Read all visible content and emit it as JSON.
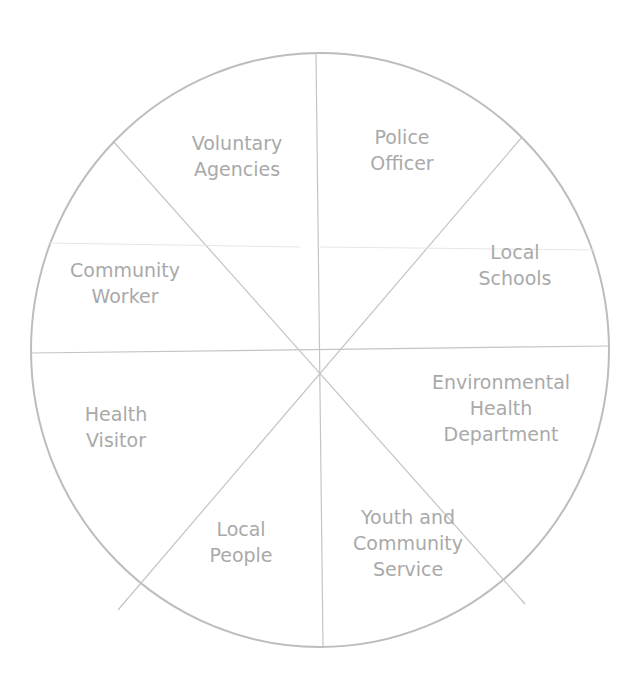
{
  "diagram": {
    "type": "segmented-circle",
    "line_color": "#bdbdbd",
    "text_color": "#a9a9a9",
    "segments": [
      {
        "lines": [
          "Voluntary",
          "Agencies"
        ],
        "x": 237,
        "y": 156
      },
      {
        "lines": [
          "Police",
          "Officer"
        ],
        "x": 402,
        "y": 150
      },
      {
        "lines": [
          "Local",
          "Schools"
        ],
        "x": 515,
        "y": 265
      },
      {
        "lines": [
          "Environmental",
          "Health",
          "Department"
        ],
        "x": 501,
        "y": 408
      },
      {
        "lines": [
          "Youth and",
          "Community",
          "Service"
        ],
        "x": 408,
        "y": 543
      },
      {
        "lines": [
          "Local",
          "People"
        ],
        "x": 241,
        "y": 542
      },
      {
        "lines": [
          "Health",
          "Visitor"
        ],
        "x": 116,
        "y": 427
      },
      {
        "lines": [
          "Community",
          "Worker"
        ],
        "x": 125,
        "y": 283
      }
    ]
  }
}
